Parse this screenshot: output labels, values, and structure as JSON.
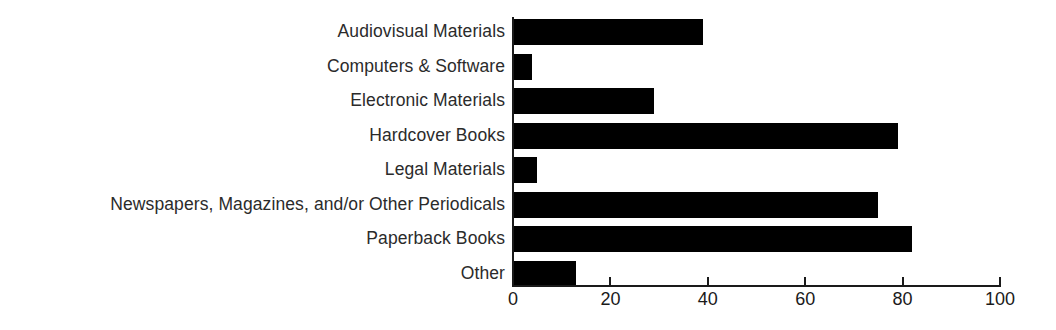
{
  "chart_data": {
    "type": "bar",
    "orientation": "horizontal",
    "title": "",
    "subtitle": "",
    "xlabel": "",
    "ylabel": "",
    "xlim": [
      0,
      100
    ],
    "xticks": [
      0,
      20,
      40,
      60,
      80,
      100
    ],
    "xtick_labels": [
      "0",
      "20",
      "40",
      "60",
      "80",
      "100"
    ],
    "grid": false,
    "legend": false,
    "bar_color": "#000000",
    "axis_color": "#1a1a1a",
    "label_color": "#2b2b2b",
    "background": "#ffffff",
    "categories": [
      "Audiovisual Materials",
      "Computers & Software",
      "Electronic Materials",
      "Hardcover Books",
      "Legal Materials",
      "Newspapers, Magazines, and/or Other Periodicals",
      "Paperback Books",
      "Other"
    ],
    "values": [
      39,
      4,
      29,
      79,
      5,
      75,
      82,
      13
    ]
  }
}
